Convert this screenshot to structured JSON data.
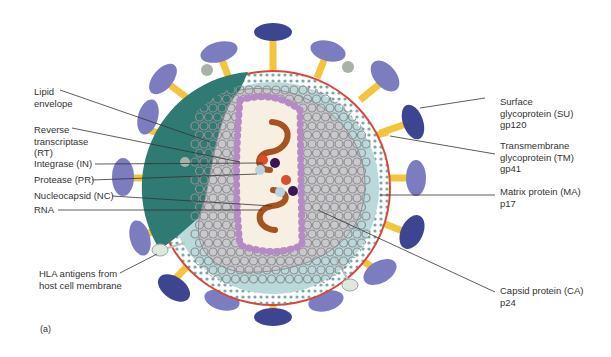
{
  "figure": {
    "panel_label": "(a)",
    "colors": {
      "spike_dark": "#3d4590",
      "spike_light": "#7c7cc0",
      "stalk": "#f2c53d",
      "matrix_left": "#2f7a72",
      "matrix_right": "#b9d9da",
      "membrane_outer": "#d9473b",
      "capsid_ring": "#8f8f94",
      "capsid_fill": "#c9c9cc",
      "nucleocapsid_ring": "#b68ac4",
      "core_interior": "#f7efe2",
      "rna": "#a8521f",
      "rt": "#e0492a",
      "integrase": "#3a1552",
      "protease": "#b5d3e2",
      "hla": "#dfe8df"
    }
  },
  "labels_left": [
    {
      "lines": [
        "Lipid",
        "envelope"
      ]
    },
    {
      "lines": [
        "Reverse",
        "transcriptase",
        "(RT)"
      ]
    },
    {
      "lines": [
        "Integrase (IN)"
      ]
    },
    {
      "lines": [
        "Protease (PR)"
      ]
    },
    {
      "lines": [
        "Nucleocapsid (NC)"
      ]
    },
    {
      "lines": [
        "RNA"
      ]
    },
    {
      "lines": [
        "HLA antigens from",
        "host cell membrane"
      ]
    }
  ],
  "labels_right": [
    {
      "lines": [
        "Surface",
        "glycoprotein (SU)",
        "gp120"
      ]
    },
    {
      "lines": [
        "Transmembrane",
        "glycoprotein (TM)",
        "gp41"
      ]
    },
    {
      "lines": [
        "Matrix protein (MA)",
        "p17"
      ]
    },
    {
      "lines": [
        "Capsid protein (CA)",
        "p24"
      ]
    }
  ]
}
